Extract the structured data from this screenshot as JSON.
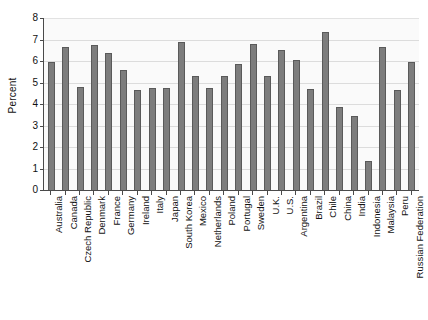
{
  "chart_data": {
    "type": "bar",
    "title": "",
    "subtitle": "",
    "xlabel": "",
    "ylabel": "Percent",
    "ylim": [
      0,
      8
    ],
    "y_ticks": [
      0,
      1,
      2,
      3,
      4,
      5,
      6,
      7,
      8
    ],
    "grid": true,
    "legend": "none",
    "orientation": "vertical",
    "categories": [
      "Australia",
      "Canada",
      "Czech Republic",
      "Denmark",
      "France",
      "Germany",
      "Ireland",
      "Italy",
      "Japan",
      "South Korea",
      "Mexico",
      "Netherlands",
      "Poland",
      "Portugal",
      "Sweden",
      "U.K.",
      "U.S.",
      "Argentina",
      "Brazil",
      "Chile",
      "China",
      "India",
      "Indonesia",
      "Malaysia",
      "Peru",
      "Russian Federation"
    ],
    "values": [
      5.95,
      6.65,
      4.8,
      6.75,
      6.35,
      5.6,
      4.65,
      4.75,
      4.75,
      6.9,
      5.3,
      4.75,
      5.3,
      5.85,
      6.8,
      5.3,
      6.5,
      6.05,
      4.7,
      7.35,
      3.85,
      3.45,
      1.35,
      6.65,
      4.65,
      5.95
    ]
  },
  "style": {
    "bar_fill": "#7d7d7d",
    "bar_edge": "#5a5a5a",
    "plot_background": "#fafafa",
    "gridline_color": "#dcdcdc",
    "axis_color": "#4a4a4a",
    "text_color": "#111111",
    "page_background": "#ffffff"
  }
}
